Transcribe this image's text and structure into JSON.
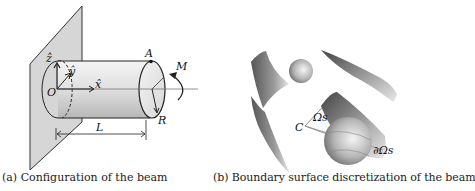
{
  "figure": {
    "panel_a": {
      "caption": "(a) Configuration of the beam",
      "labels": {
        "z_axis": "ẑ",
        "y_axis": "ŷ",
        "x_axis": "x̂",
        "origin": "O",
        "point_A": "A",
        "moment": "M",
        "radius": "R",
        "length": "L"
      }
    },
    "panel_b": {
      "caption": "(b) Boundary surface discretization of the beam",
      "labels": {
        "point_C": "C",
        "omega_s": "Ωs",
        "boundary_omega_s": "∂Ωs"
      }
    }
  }
}
